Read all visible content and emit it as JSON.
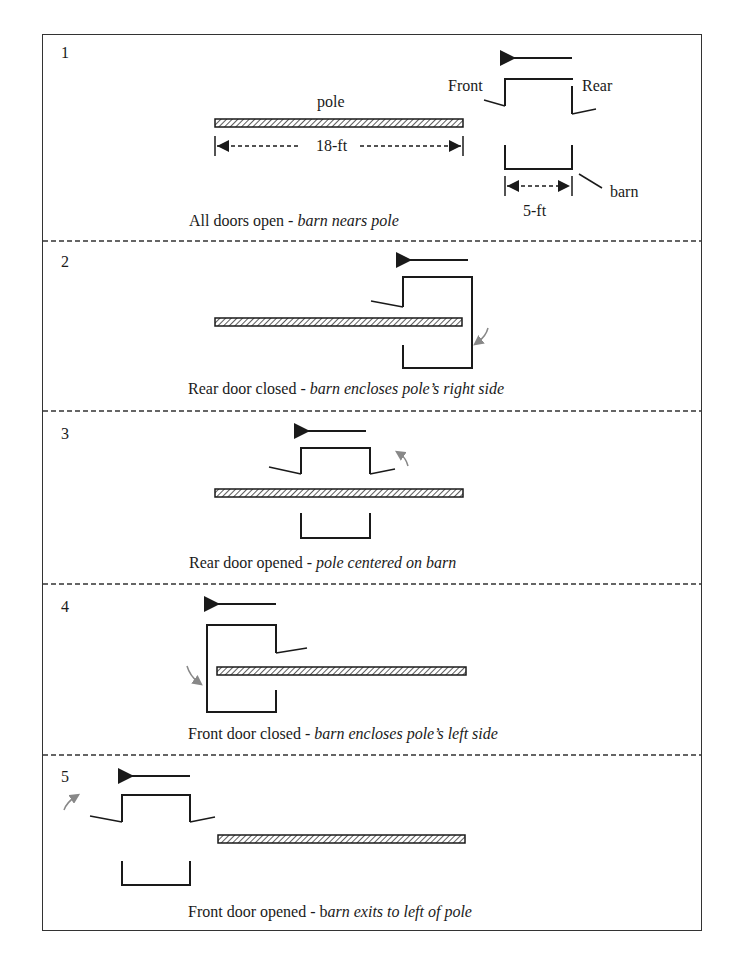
{
  "diagram": {
    "units": {
      "pole_length": "18-ft",
      "barn_length": "5-ft"
    },
    "labels": {
      "pole": "pole",
      "front": "Front",
      "rear": "Rear",
      "barn": "barn"
    },
    "panels": [
      {
        "number": "1",
        "caption_plain": "All doors open - ",
        "caption_italic": "barn nears pole"
      },
      {
        "number": "2",
        "caption_plain": "Rear door closed - ",
        "caption_italic": "barn encloses pole’s right side"
      },
      {
        "number": "3",
        "caption_plain": "Rear door opened - ",
        "caption_italic": "pole centered on barn"
      },
      {
        "number": "4",
        "caption_plain": "Front door closed - ",
        "caption_italic": "barn encloses pole’s left side"
      },
      {
        "number": "5",
        "caption_plain": "Front door opened - b",
        "caption_italic": "arn exits to left of pole"
      }
    ],
    "colors": {
      "line": "#1a1a1a",
      "gray_arrow": "#888888",
      "border": "#333333"
    }
  }
}
